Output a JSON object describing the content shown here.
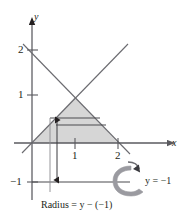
{
  "figure": {
    "name": "solid-of-revolution-washer-diagram",
    "axes": {
      "x_axis_label": "x",
      "y_axis_label": "y",
      "x_ticks": [
        {
          "value": 1,
          "label": "1",
          "px": 75
        },
        {
          "value": 2,
          "label": "2",
          "px": 118
        }
      ],
      "y_ticks": [
        {
          "value": 2,
          "label": "2",
          "px": 50
        },
        {
          "value": 1,
          "label": "1",
          "px": 95
        },
        {
          "value": -1,
          "label": "−1",
          "px": 182
        }
      ],
      "origin_px": {
        "x": 32,
        "y": 143
      },
      "unit_px": {
        "x": 43,
        "y": 46
      }
    },
    "annotations": {
      "axis_of_revolution_label": "y = −1",
      "radius_caption": "Radius = y − (−1)",
      "rotation_icon": "curved-rotation-arrow"
    },
    "colors": {
      "ink": "#231f20",
      "line": "#5a5a5f",
      "shade_fill": "#d6d6d6",
      "background": "#ffffff"
    },
    "region": {
      "description": "triangle bounded by y = x, y = 2 − x and the x-axis",
      "vertices": [
        [
          0,
          0
        ],
        [
          2,
          0
        ],
        [
          1,
          1
        ]
      ]
    },
    "slice": {
      "description": "horizontal representative rectangle (washer slice)",
      "y_top": 118,
      "y_bottom": 125
    }
  }
}
